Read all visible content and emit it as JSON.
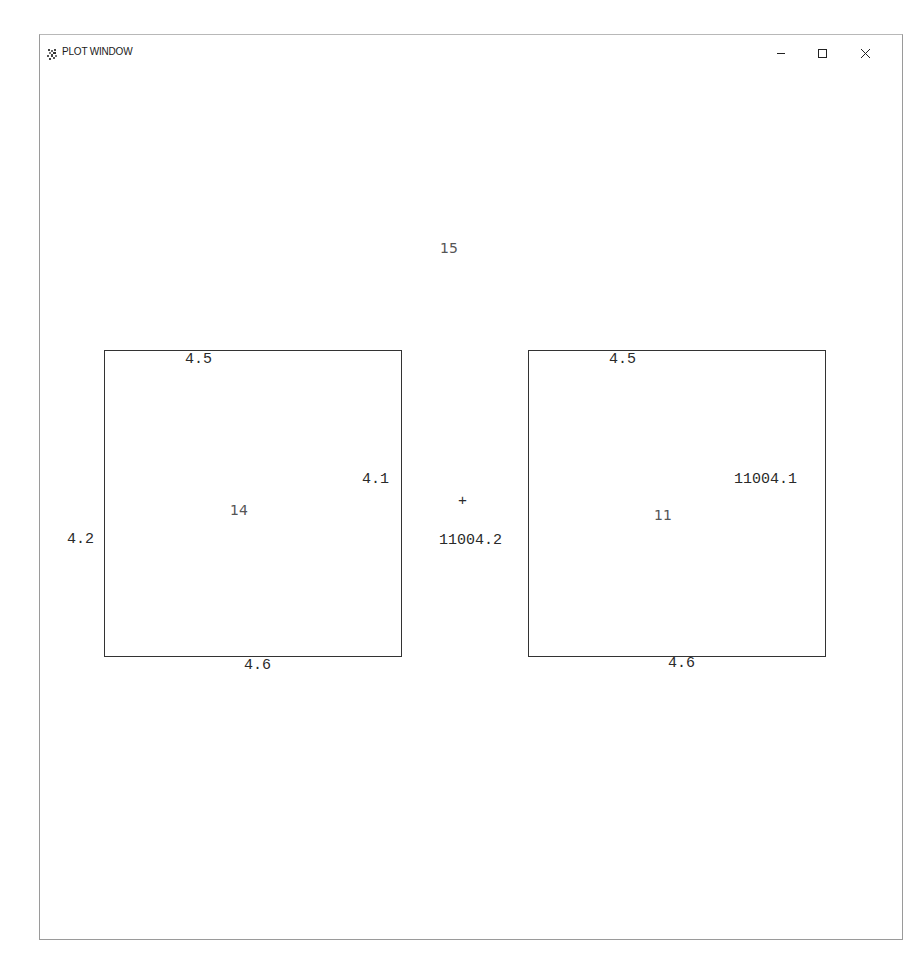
{
  "window": {
    "title": "PLOT WINDOW",
    "controls": {
      "minimize": "minimize",
      "maximize": "maximize",
      "close": "close"
    }
  },
  "plot": {
    "top_label": "15",
    "center_marker": "+",
    "center_label": "11004.2",
    "left_box": {
      "top": "4.5",
      "bottom": "4.6",
      "left": "4.2",
      "right": "4.1",
      "center": "14"
    },
    "right_box": {
      "top": "4.5",
      "bottom": "4.6",
      "right": "11004.1",
      "center": "11"
    }
  },
  "colors": {
    "border": "#333333",
    "label_dark": "#2a2a2a",
    "label_light": "#555555",
    "background": "#ffffff"
  }
}
